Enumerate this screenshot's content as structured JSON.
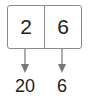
{
  "diagram": {
    "cells": [
      {
        "value": "2"
      },
      {
        "value": "6"
      }
    ],
    "outputs": [
      {
        "value": "20"
      },
      {
        "value": "6"
      }
    ],
    "colors": {
      "border": "#8a8a8a",
      "arrow": "#777777",
      "text": "#222222"
    }
  }
}
